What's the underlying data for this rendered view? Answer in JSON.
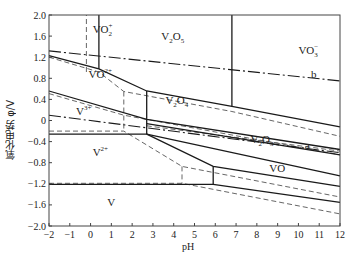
{
  "plot": {
    "px_left": 49,
    "px_right": 340,
    "px_top": 15,
    "px_bottom": 226,
    "x_range": [
      -2,
      12
    ],
    "y_range": [
      -2.0,
      2.0
    ],
    "line_color": "#1a1a1a",
    "dash_color": "#555555",
    "frame_color": "#444444"
  },
  "axes": {
    "xlabel": "pH",
    "ylabel": "氧化电势 φ/V",
    "xticks": [
      -2,
      -1,
      0,
      1,
      2,
      3,
      4,
      5,
      6,
      7,
      8,
      9,
      10,
      11,
      12
    ],
    "xtick_labels": [
      "−2",
      "−1",
      "0",
      "1",
      "2",
      "3",
      "4",
      "5",
      "6",
      "7",
      "8",
      "9",
      "10",
      "11",
      "12"
    ],
    "yticks": [
      2.0,
      1.6,
      1.2,
      0.8,
      0.4,
      0,
      -0.4,
      -0.8,
      -1.2,
      -1.6,
      -2.0
    ],
    "ytick_labels": [
      "2.0",
      "1.6",
      "1.2",
      "0.8",
      "0.4",
      "0",
      "−0.4",
      "−0.8",
      "−1.2",
      "−1.6",
      "−2.0"
    ]
  },
  "regions": [
    {
      "name": "VO2+",
      "text": "VO",
      "sup": "+",
      "sub": "2",
      "x": 0.1,
      "y": 1.66
    },
    {
      "name": "V2O5",
      "text": "V",
      "sub1": "2",
      "mid": "O",
      "sub2": "5",
      "x": 3.4,
      "y": 1.52
    },
    {
      "name": "VO3-",
      "text": "VO",
      "sub": "3",
      "sup": "−",
      "x": 10.0,
      "y": 1.27
    },
    {
      "name": "VO2+ion",
      "text": "VO",
      "sup": "2+",
      "x": -0.1,
      "y": 0.8
    },
    {
      "name": "V2O4",
      "text": "V",
      "sub1": "2",
      "mid": "O",
      "sub2": "4",
      "x": 3.6,
      "y": 0.32
    },
    {
      "name": "V3+",
      "text": "V",
      "sup": "3+",
      "x": -0.7,
      "y": 0.1
    },
    {
      "name": "V2+",
      "text": "V",
      "sup": "2+",
      "x": 0.1,
      "y": -0.68
    },
    {
      "name": "V2O3",
      "text": "V",
      "sub1": "2",
      "mid": "O",
      "sub2": "3",
      "x": 7.7,
      "y": -0.42
    },
    {
      "name": "VO",
      "text": "VO",
      "x": 8.6,
      "y": -0.97
    },
    {
      "name": "V",
      "text": "V",
      "x": 0.8,
      "y": -1.62
    }
  ],
  "line_labels": [
    {
      "text": "b",
      "x": 10.6,
      "y": 0.87
    },
    {
      "text": "a",
      "x": 10.3,
      "y": -0.49
    }
  ],
  "solid_lines": [
    [
      [
        -2,
        1.23
      ],
      [
        0.4,
        0.98
      ],
      [
        2.7,
        0.56
      ],
      [
        6.8,
        0.27
      ],
      [
        12,
        -0.12
      ]
    ],
    [
      [
        -2,
        0.56
      ],
      [
        2.7,
        0.02
      ],
      [
        12,
        -0.55
      ]
    ],
    [
      [
        -2,
        -0.26
      ],
      [
        2.7,
        -0.26
      ],
      [
        12,
        -1.05
      ]
    ],
    [
      [
        -2,
        -1.21
      ],
      [
        5.9,
        -1.21
      ],
      [
        12,
        -1.55
      ]
    ],
    [
      [
        2.7,
        0.56
      ],
      [
        2.7,
        -0.26
      ]
    ],
    [
      [
        0.4,
        0.98
      ],
      [
        0.4,
        2.0
      ]
    ],
    [
      [
        6.8,
        0.27
      ],
      [
        6.8,
        2.0
      ]
    ],
    [
      [
        2.7,
        -0.26
      ],
      [
        5.9,
        -0.87
      ],
      [
        12,
        -1.25
      ]
    ],
    [
      [
        5.9,
        -0.87
      ],
      [
        5.9,
        -1.21
      ]
    ],
    [
      [
        2.7,
        -0.06
      ],
      [
        12,
        -0.65
      ]
    ]
  ],
  "dashed_lines": [
    [
      [
        -2,
        1.2
      ],
      [
        0.4,
        0.92
      ],
      [
        1.6,
        0.55
      ],
      [
        6.8,
        0.17
      ],
      [
        12,
        -0.3
      ]
    ],
    [
      [
        -2,
        0.51
      ],
      [
        1.6,
        0.1
      ],
      [
        12,
        -0.65
      ]
    ],
    [
      [
        -2,
        -0.2
      ],
      [
        1.6,
        -0.2
      ],
      [
        4.4,
        -0.87
      ],
      [
        12,
        -1.45
      ]
    ],
    [
      [
        -2,
        -1.19
      ],
      [
        4.4,
        -1.19
      ],
      [
        12,
        -1.77
      ]
    ],
    [
      [
        1.6,
        0.55
      ],
      [
        1.6,
        -0.2
      ]
    ],
    [
      [
        -0.2,
        0.92
      ],
      [
        -0.2,
        2.0
      ]
    ],
    [
      [
        4.4,
        -0.87
      ],
      [
        4.4,
        -1.19
      ]
    ],
    [
      [
        2.7,
        -0.1
      ],
      [
        12,
        -0.58
      ]
    ]
  ],
  "dashdot_lines": [
    {
      "id": "b",
      "pts": [
        [
          -2,
          1.32
        ],
        [
          12,
          0.75
        ]
      ]
    },
    {
      "id": "a",
      "pts": [
        [
          -2,
          0.1
        ],
        [
          12,
          -0.61
        ]
      ]
    }
  ]
}
